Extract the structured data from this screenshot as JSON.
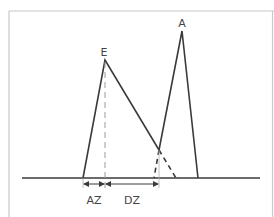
{
  "diagram": {
    "type": "peak-separation",
    "labels": {
      "peak_early": "E",
      "peak_late": "A",
      "zone_left": "AZ",
      "zone_right": "DZ"
    },
    "colors": {
      "line": "#3a3a3a",
      "frame": "#c8c8c8",
      "dashed_guide": "#9a9a9a",
      "text": "#444444"
    },
    "geometry": {
      "baseline": {
        "x1": 22,
        "x2": 260,
        "y": 178
      },
      "peak_E": {
        "base_left": [
          83,
          178
        ],
        "apex": [
          105,
          60
        ],
        "intersection": [
          159,
          150
        ],
        "tail_end": [
          176,
          178
        ]
      },
      "peak_A": {
        "base_left": [
          154,
          178
        ],
        "intersection": [
          159,
          150
        ],
        "apex": [
          182,
          31
        ],
        "base_right": [
          198,
          178
        ]
      },
      "arrows": {
        "AZ": {
          "x1": 83,
          "x2": 105,
          "y": 184
        },
        "DZ": {
          "x1": 105,
          "x2": 159,
          "y": 184
        }
      }
    }
  }
}
